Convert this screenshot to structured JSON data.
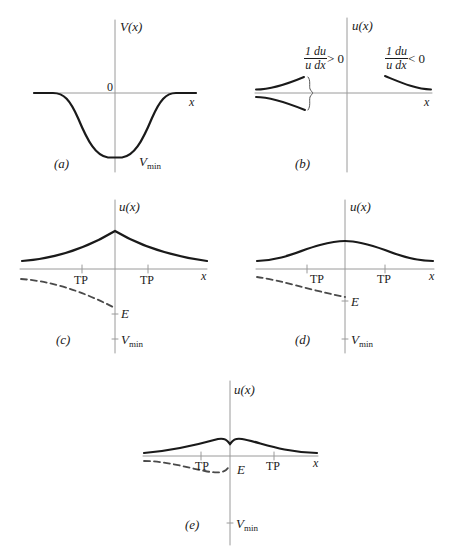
{
  "figure": {
    "panels": [
      {
        "id": "a",
        "caption": "(a)",
        "y_axis_label": "V(x)",
        "x_axis_label": "x",
        "origin_label": "0",
        "curve_label_main": "V",
        "curve_label_sub": "min",
        "description": "Potential well V(x): flat at 0 far away, dipping smoothly to V_min at the center"
      },
      {
        "id": "b",
        "caption": "(b)",
        "y_axis_label": "u(x)",
        "x_axis_label": "x",
        "left_annotation": {
          "num": "1 du",
          "den": "u dx",
          "relation": "> 0"
        },
        "right_annotation": {
          "num": "1 du",
          "den": "u dx",
          "relation": "< 0"
        },
        "description": "Wavefunction tails: on the left, curves diverging from the axis (1/u du/dx > 0); on the right, curve decaying toward the axis (1/u du/dx < 0)"
      },
      {
        "id": "c",
        "caption": "(c)",
        "y_axis_label": "u(x)",
        "x_axis_label": "x",
        "tick_labels": [
          "TP",
          "TP"
        ],
        "energy_label": "E",
        "vmin_main": "V",
        "vmin_sub": "min",
        "description": "Cusp-shaped u(x) peaked at x=0; dashed potential curve reaching E near the axis"
      },
      {
        "id": "d",
        "caption": "(d)",
        "y_axis_label": "u(x)",
        "x_axis_label": "x",
        "tick_labels": [
          "TP",
          "TP"
        ],
        "energy_label": "E",
        "vmin_main": "V",
        "vmin_sub": "min",
        "description": "Smooth bell-shaped u(x); dashed potential curve meeting E at the axis"
      },
      {
        "id": "e",
        "caption": "(e)",
        "y_axis_label": "u(x)",
        "x_axis_label": "x",
        "tick_labels": [
          "TP",
          "TP"
        ],
        "energy_label": "E",
        "vmin_main": "V",
        "vmin_sub": "min",
        "description": "u(x) with two humps and a dip at x=0; dashed potential curve dipping below E then rising to the axis"
      }
    ],
    "colors": {
      "curve": "#1a1a1a",
      "axis": "#9a9a9a",
      "dashed": "#4a4a4a"
    }
  }
}
